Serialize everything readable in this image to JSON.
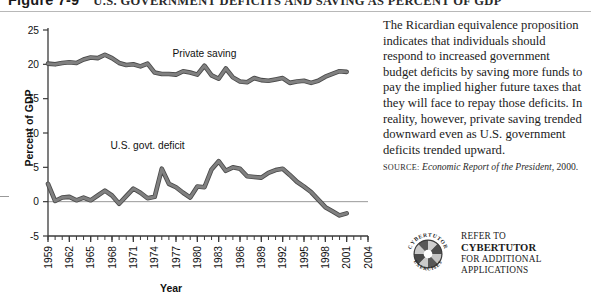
{
  "figure": {
    "number": "Figure 7-9",
    "title": "U.S. Government Deficits and Saving as Percent of GDP"
  },
  "chart_data": {
    "type": "line",
    "title": "U.S. Government Deficits and Saving as Percent of GDP",
    "xlabel": "Year",
    "ylabel": "Percent of GDP",
    "xlim": [
      1959,
      2004
    ],
    "ylim": [
      -5,
      25
    ],
    "yticks": [
      -5,
      0,
      5,
      10,
      15,
      20,
      25
    ],
    "xticks": [
      1959,
      1962,
      1965,
      1968,
      1971,
      1974,
      1977,
      1980,
      1983,
      1986,
      1989,
      1992,
      1995,
      1998,
      2001,
      2004
    ],
    "grid": false,
    "legend": "inline-annotations",
    "annotations": [
      {
        "text": "Private saving",
        "x": 1981,
        "y": 21.0
      },
      {
        "text": "U.S. govt. deficit",
        "x": 1973,
        "y": 7.6
      }
    ],
    "series": [
      {
        "name": "Private saving",
        "color": "#808080",
        "x": [
          1959,
          1960,
          1961,
          1962,
          1963,
          1964,
          1965,
          1966,
          1967,
          1968,
          1969,
          1970,
          1971,
          1972,
          1973,
          1974,
          1975,
          1976,
          1977,
          1978,
          1979,
          1980,
          1981,
          1982,
          1983,
          1984,
          1985,
          1986,
          1987,
          1988,
          1989,
          1990,
          1991,
          1992,
          1993,
          1994,
          1995,
          1996,
          1997,
          1998,
          1999,
          2000,
          2001
        ],
        "values": [
          20.1,
          20.0,
          20.2,
          20.3,
          20.2,
          20.7,
          21.0,
          20.9,
          21.4,
          20.9,
          20.2,
          19.9,
          20.0,
          19.7,
          20.1,
          18.8,
          18.6,
          18.6,
          18.5,
          19.0,
          18.8,
          18.5,
          19.8,
          18.4,
          17.9,
          19.4,
          18.1,
          17.5,
          17.4,
          18.0,
          17.7,
          17.6,
          17.8,
          18.0,
          17.3,
          17.5,
          17.6,
          17.3,
          17.6,
          18.2,
          18.6,
          19.0,
          18.9
        ]
      },
      {
        "name": "U.S. govt. deficit",
        "color": "#808080",
        "x": [
          1959,
          1960,
          1961,
          1962,
          1963,
          1964,
          1965,
          1966,
          1967,
          1968,
          1969,
          1970,
          1971,
          1972,
          1973,
          1974,
          1975,
          1976,
          1977,
          1978,
          1979,
          1980,
          1981,
          1982,
          1983,
          1984,
          1985,
          1986,
          1987,
          1988,
          1989,
          1990,
          1991,
          1992,
          1993,
          1994,
          1995,
          1996,
          1997,
          1998,
          1999,
          2000,
          2001
        ],
        "values": [
          2.6,
          0.1,
          0.6,
          0.7,
          0.2,
          0.6,
          0.2,
          0.9,
          1.6,
          0.9,
          -0.3,
          0.8,
          1.9,
          1.3,
          0.5,
          0.7,
          4.8,
          2.6,
          2.1,
          1.3,
          0.6,
          2.2,
          2.1,
          4.7,
          5.9,
          4.5,
          5.0,
          4.8,
          3.7,
          3.6,
          3.5,
          4.2,
          4.6,
          4.8,
          3.9,
          2.9,
          2.2,
          1.4,
          0.3,
          -0.8,
          -1.4,
          -2.0,
          -1.7
        ]
      }
    ]
  },
  "caption": {
    "paragraph": "The Ricardian equivalence proposition indicates that individuals should respond to increased government budget deficits by saving more funds to pay the implied higher future taxes that they will face to repay those deficits. In reality, however, private saving trended downward even as U.S. government deficits trended upward.",
    "source_kicker": "Source:",
    "source_italic": "Economic Report of the President,",
    "source_rest": "2000."
  },
  "cybertutor": {
    "logo_ring_top": "CYBERTUTOR",
    "logo_ring_bottom": "EXERCISES",
    "line1": "Refer to",
    "line2": "Cybertutor",
    "line3": "for additional",
    "line4": "applications"
  }
}
